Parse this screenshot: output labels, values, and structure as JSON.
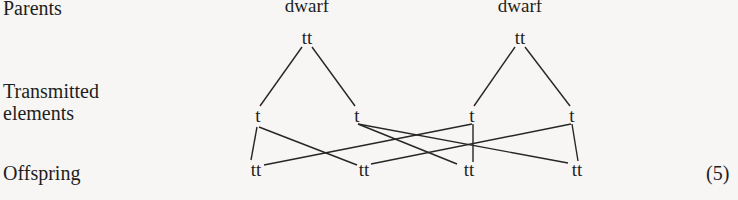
{
  "row_labels": {
    "parents": "Parents",
    "transmitted_1": "Transmitted",
    "transmitted_2": "elements",
    "offspring": "Offspring"
  },
  "parents": [
    {
      "phenotype": "dwarf",
      "genotype": "tt"
    },
    {
      "phenotype": "dwarf",
      "genotype": "tt"
    }
  ],
  "transmitted": [
    "t",
    "t",
    "t",
    "t"
  ],
  "offspring": [
    "tt",
    "tt",
    "tt",
    "tt"
  ],
  "equation_number": "(5)",
  "edges": [
    {
      "from": "parent-0",
      "to": "transmitted-0"
    },
    {
      "from": "parent-0",
      "to": "transmitted-1"
    },
    {
      "from": "parent-1",
      "to": "transmitted-2"
    },
    {
      "from": "parent-1",
      "to": "transmitted-3"
    },
    {
      "from": "transmitted-0",
      "to": "offspring-0"
    },
    {
      "from": "transmitted-0",
      "to": "offspring-1"
    },
    {
      "from": "transmitted-1",
      "to": "offspring-2"
    },
    {
      "from": "transmitted-1",
      "to": "offspring-3"
    },
    {
      "from": "transmitted-2",
      "to": "offspring-0"
    },
    {
      "from": "transmitted-2",
      "to": "offspring-2"
    },
    {
      "from": "transmitted-3",
      "to": "offspring-1"
    },
    {
      "from": "transmitted-3",
      "to": "offspring-3"
    }
  ]
}
